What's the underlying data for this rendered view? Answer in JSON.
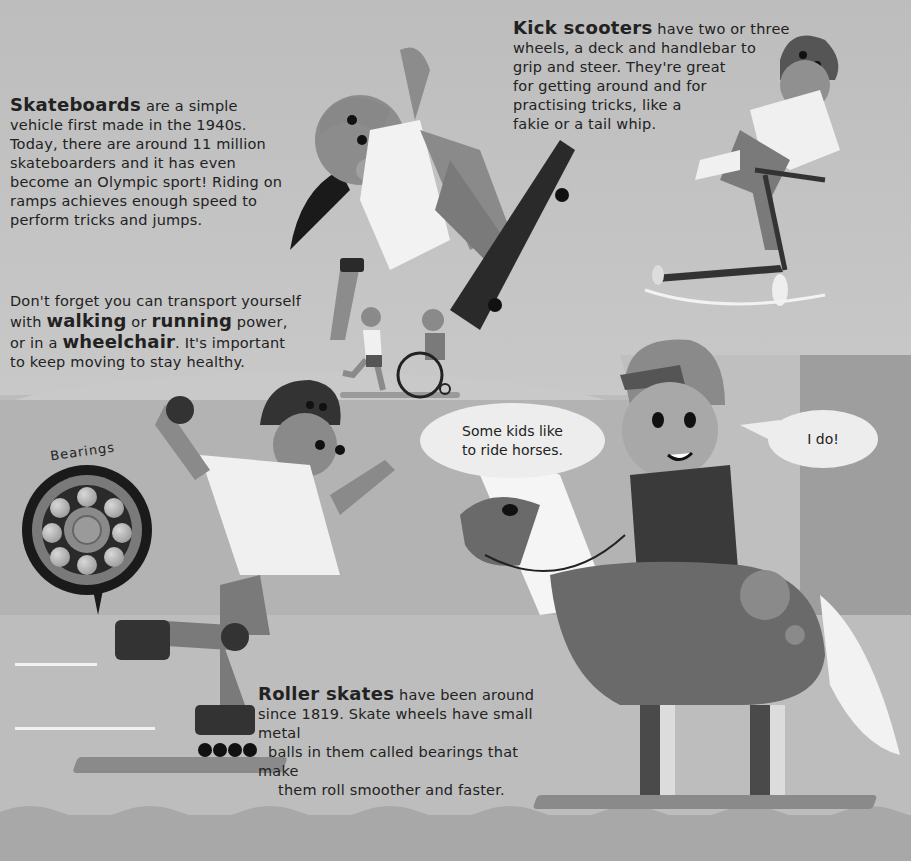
{
  "skateboards": {
    "lead": "Skateboards",
    "lines": [
      " are a simple",
      "vehicle first made in the 1940s.",
      "Today, there are around 11 million",
      "skateboarders and it has even",
      "become an Olympic sport! Riding on",
      "ramps achieves enough speed to",
      "perform tricks and jumps."
    ]
  },
  "kick_scooters": {
    "lead": "Kick scooters",
    "lines": [
      " have two or three",
      "wheels, a deck and handlebar to",
      "grip and steer. They're great",
      "for getting around and for",
      "practising tricks, like a",
      "fakie or a tail whip."
    ]
  },
  "moving": {
    "line1": "Don't forget you can transport yourself",
    "line2_pre": "with ",
    "line2_em1": "walking",
    "line2_mid": " or ",
    "line2_em2": "running",
    "line2_post": " power,",
    "line3_pre": "or in a ",
    "line3_em": "wheelchair",
    "line3_post": ". It's important",
    "line4": "to keep moving to stay healthy."
  },
  "roller_skates": {
    "lead": "Roller skates",
    "lines": [
      " have been around",
      "since 1819. Skate wheels have small metal",
      "balls in them called bearings that make",
      "them roll smoother and faster."
    ]
  },
  "bearings": {
    "label": "Bearings",
    "icon": "bearing-diagram-icon"
  },
  "speech": {
    "left_line1": "Some kids like",
    "left_line2": "to ride horses.",
    "right": "I do!"
  },
  "illustrations": {
    "skateboarder": "skateboarder-girl-illustration",
    "scooter_rider": "scooter-boy-illustration",
    "runner": "running-child-illustration",
    "wheelchair_user": "wheelchair-user-illustration",
    "roller_skater": "roller-skater-illustration",
    "horse_rider": "horse-rider-illustration"
  },
  "colors": {
    "sky": "#bdbdbd",
    "ground": "#b3b3b3",
    "ramp": "#9e9e9e",
    "text": "#222222",
    "bubble": "#ededed"
  }
}
